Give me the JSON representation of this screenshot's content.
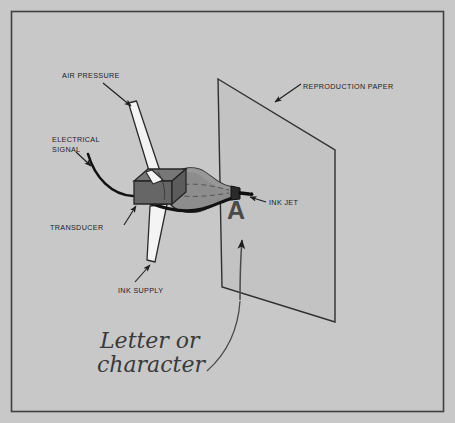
{
  "figure": {
    "background_color": "#c8c8c8",
    "frame_color": "#3a3a3a",
    "paper_fill": "#c2c2c2",
    "transducer_color": "#6e6e6e",
    "chamber_color": "#8a8a8a",
    "tube_color": "#f2f2f2",
    "wire_color": "#111111",
    "ink_color": "#141414"
  },
  "labels": {
    "air_pressure": "AIR PRESSURE",
    "electrical_signal_line1": "ELECTRICAL",
    "electrical_signal_line2": "SIGNAL",
    "transducer": "TRANSDUCER",
    "ink_supply": "INK SUPPLY",
    "reproduction_paper": "REPRODUCTION PAPER",
    "ink_jet": "INK JET",
    "printed_character": "A",
    "handwritten_line1": "Letter or",
    "handwritten_line2": "character"
  }
}
